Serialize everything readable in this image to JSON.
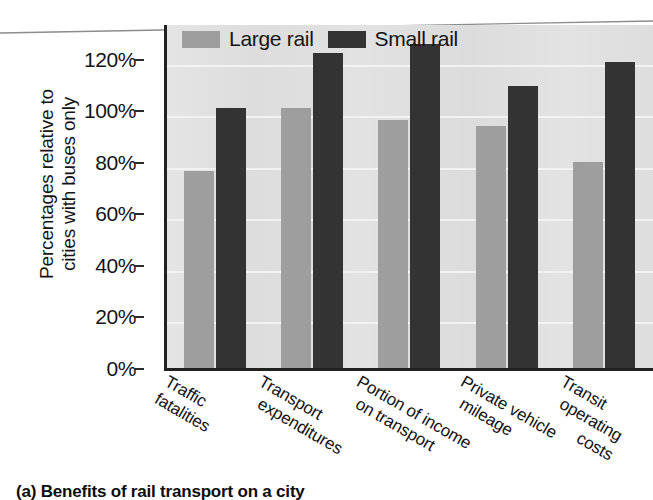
{
  "figure": {
    "caption": "(a) Benefits of rail transport on a city"
  },
  "legend": {
    "position": "top-left-inside",
    "entries": [
      {
        "label": "Large rail",
        "color": "#9e9e9e",
        "swatch": "legend-swatch-large-rail"
      },
      {
        "label": "Small rail",
        "color": "#333333",
        "swatch": "legend-swatch-small-rail"
      }
    ]
  },
  "y_axis": {
    "title_line1": "Percentages relative to",
    "title_line2": "cities with buses only",
    "ticks": [
      "0%",
      "20%",
      "40%",
      "60%",
      "80%",
      "100%",
      "120%"
    ],
    "min": 0,
    "max": 120
  },
  "x_axis": {
    "labels": [
      {
        "line1": "Traffic",
        "line2": "fatalities"
      },
      {
        "line1": "Transport",
        "line2": "expenditures"
      },
      {
        "line1": "Portion of income",
        "line2": "on transport"
      },
      {
        "line1": "Private vehicle",
        "line2": "mileage"
      },
      {
        "line1": "Transit",
        "line2": "operating"
      },
      {
        "line1": "costs",
        "line2": ""
      }
    ]
  },
  "chart_data": {
    "type": "bar",
    "title": "(a) Benefits of rail transport on a city",
    "xlabel": "",
    "ylabel": "Percentages relative to cities with buses only",
    "ylim": [
      0,
      120
    ],
    "ytick_values": [
      0,
      20,
      40,
      60,
      80,
      100,
      120
    ],
    "ytick_labels": [
      "0%",
      "20%",
      "40%",
      "60%",
      "80%",
      "100%",
      "120%"
    ],
    "grid": true,
    "grid_axis": "y",
    "legend_position": "upper left (inside plot)",
    "categories": [
      "Traffic fatalities",
      "Transport expenditures",
      "Portion of income on transport",
      "Private vehicle mileage",
      "Transit operating costs"
    ],
    "series": [
      {
        "name": "Large rail",
        "color": "#9e9e9e",
        "values": [
          65,
          86,
          82,
          80,
          68
        ]
      },
      {
        "name": "Small rail",
        "color": "#333333",
        "values": [
          86,
          104,
          107,
          93,
          101
        ]
      }
    ],
    "units": "percent relative to cities with buses only"
  },
  "colors": {
    "plot_background": "#d9d9d9",
    "gridline": "#f2f2f2",
    "axis": "#212121",
    "large_rail": "#9e9e9e",
    "small_rail": "#333333"
  }
}
